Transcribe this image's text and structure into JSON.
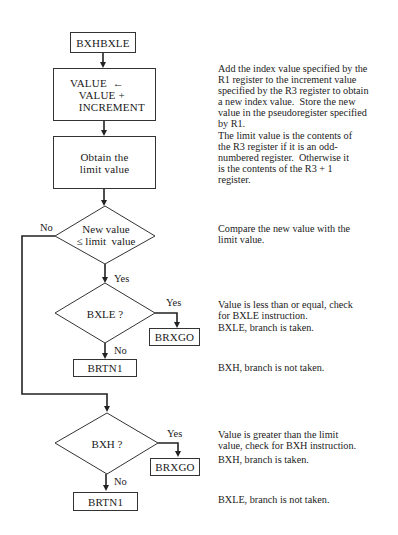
{
  "flowchart": {
    "start_box": {
      "label": "BXHBXLE"
    },
    "compute_box": {
      "lines": "VALUE  ←\n   VALUE +\n   INCREMENT"
    },
    "limit_box": {
      "lines": "Obtain the\nlimit value"
    },
    "decision_compare": {
      "lines": "New value\n≤ limit  value",
      "no_label": "No",
      "yes_label": "Yes"
    },
    "decision_bxle": {
      "label": "BXLE ?",
      "yes_label": "Yes",
      "no_label": "No"
    },
    "bxle_taken_box": {
      "label": "BRXGO"
    },
    "bxle_not_taken_box": {
      "label": "BRTN1"
    },
    "decision_bxh": {
      "label": "BXH ?",
      "yes_label": "Yes",
      "no_label": "No"
    },
    "bxh_taken_box": {
      "label": "BRXGO"
    },
    "bxh_not_taken_box": {
      "label": "BRTN1"
    }
  },
  "descriptions": {
    "compute": "Add the index value specified by the\nR1 register to the increment value\nspecified by the R3 register to obtain\na new index value.  Store the new\nvalue in the pseudoregister specified\nby R1.",
    "limit": "The limit value is the contents of\nthe R3 register if it is an odd-\nnumbered register.  Otherwise it\nis the contents of the R3 + 1\nregister.",
    "compare": "Compare the new value with the\nlimit value.",
    "bxle_check": "Value is less than or equal, check\nfor BXLE instruction.",
    "bxle_taken": "BXLE, branch is taken.",
    "bxh_not_taken": "BXH, branch is not taken.",
    "bxh_check": "Value is greater than the limit\nvalue, check for BXH instruction.",
    "bxh_taken": "BXH, branch is taken.",
    "bxle_not_taken": "BXLE, branch is not taken."
  }
}
